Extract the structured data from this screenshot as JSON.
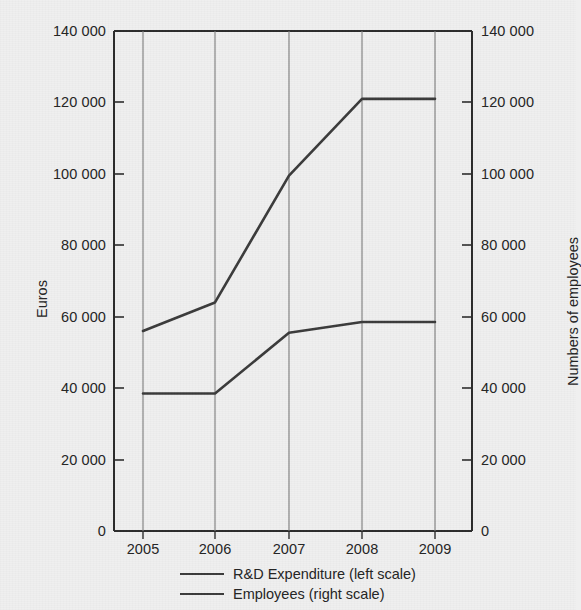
{
  "chart_data": {
    "type": "line",
    "title": "",
    "subtitle": "",
    "xlabel": "",
    "ylabel": "Euros",
    "y2label": "Numbers of employees",
    "categories": [
      "2005",
      "2006",
      "2007",
      "2008",
      "2009"
    ],
    "x": [
      2005,
      2006,
      2007,
      2008,
      2009
    ],
    "ylim": [
      0,
      140000
    ],
    "y2lim": [
      0,
      140000
    ],
    "yticks": [
      0,
      20000,
      40000,
      60000,
      80000,
      100000,
      120000,
      140000
    ],
    "ytick_labels": [
      "0",
      "20 000",
      "40 000",
      "60 000",
      "80 000",
      "100 000",
      "120 000",
      "140 000"
    ],
    "y2ticks": [
      0,
      20000,
      40000,
      60000,
      80000,
      100000,
      120000,
      140000
    ],
    "y2tick_labels": [
      "0",
      "20 000",
      "40 000",
      "60 000",
      "80 000",
      "100 000",
      "120 000",
      "140 000"
    ],
    "grid": "vertical-only",
    "legend_position": "bottom-center",
    "line_color": "#3a3a3a",
    "background_color": "#efefef",
    "axis_color": "#2b2b2b",
    "gridline_color": "#6e6e6e",
    "series": [
      {
        "name": "R&D Expenditure (left scale)",
        "axis": "left",
        "values": [
          56000,
          64000,
          99500,
          121000,
          121000
        ]
      },
      {
        "name": "Employees (right scale)",
        "axis": "right",
        "values": [
          38500,
          38500,
          55500,
          58500,
          58500
        ]
      }
    ]
  },
  "axes": {
    "left_title": "Euros",
    "right_title": "Numbers of employees",
    "left_ticks": [
      "140 000",
      "120 000",
      "100 000",
      "80 000",
      "60 000",
      "40 000",
      "20 000",
      "0"
    ],
    "right_ticks": [
      "140 000",
      "120 000",
      "100 000",
      "80 000",
      "60 000",
      "40 000",
      "20 000",
      "0"
    ],
    "x_ticks": [
      "2005",
      "2006",
      "2007",
      "2008",
      "2009"
    ]
  },
  "legend": {
    "items": [
      {
        "label": "R&D Expenditure (left scale)"
      },
      {
        "label": "Employees (right scale)"
      }
    ]
  },
  "artifacts": {
    "cropped_header_text": ""
  }
}
